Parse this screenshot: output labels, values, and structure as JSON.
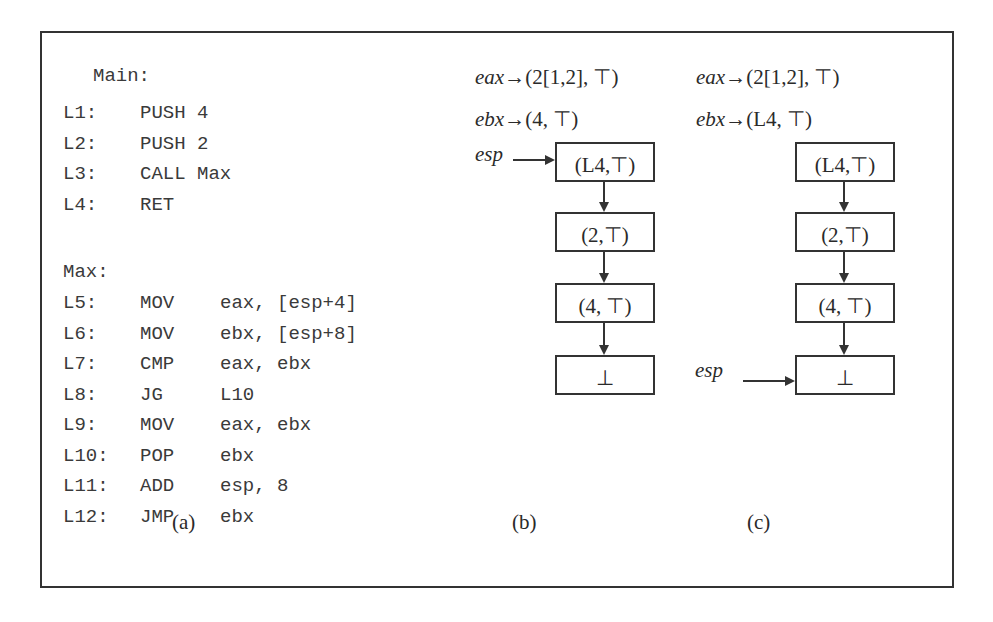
{
  "panel_a": {
    "main_label": "Main:",
    "main_lines": [
      {
        "label": "L1:",
        "op": "PUSH",
        "args": "4"
      },
      {
        "label": "L2:",
        "op": "PUSH",
        "args": "2"
      },
      {
        "label": "L3:",
        "op": "CALL",
        "args": "Max"
      },
      {
        "label": "L4:",
        "op": "RET",
        "args": ""
      }
    ],
    "max_label": "Max:",
    "max_lines": [
      {
        "label": "L5:",
        "op": "MOV",
        "args": "eax, [esp+4]"
      },
      {
        "label": "L6:",
        "op": "MOV",
        "args": "ebx, [esp+8]"
      },
      {
        "label": "L7:",
        "op": "CMP",
        "args": "eax, ebx"
      },
      {
        "label": "L8:",
        "op": "JG",
        "args": "L10"
      },
      {
        "label": "L9:",
        "op": "MOV",
        "args": "eax, ebx"
      },
      {
        "label": "L10:",
        "op": "POP",
        "args": "ebx"
      },
      {
        "label": "L11:",
        "op": "ADD",
        "args": "esp, 8"
      },
      {
        "label": "L12:",
        "op": "JMP",
        "args": "ebx"
      }
    ],
    "caption": "(a)"
  },
  "panel_b": {
    "eax": {
      "reg": "eax",
      "arrow": "→",
      "value": "(2[1,2], ⊤)"
    },
    "ebx": {
      "reg": "ebx",
      "arrow": "→",
      "value": "(4, ⊤)"
    },
    "esp_label": "esp",
    "esp_points_to_index": 0,
    "stack": [
      "(L4,⊤)",
      "(2,⊤)",
      "(4, ⊤)",
      "⊥"
    ],
    "caption": "(b)"
  },
  "panel_c": {
    "eax": {
      "reg": "eax",
      "arrow": "→",
      "value": "(2[1,2], ⊤)"
    },
    "ebx": {
      "reg": "ebx",
      "arrow": "→",
      "value": "(L4, ⊤)"
    },
    "esp_label": "esp",
    "esp_points_to_index": 3,
    "stack": [
      "(L4,⊤)",
      "(2,⊤)",
      "(4, ⊤)",
      "⊥"
    ],
    "caption": "(c)"
  }
}
